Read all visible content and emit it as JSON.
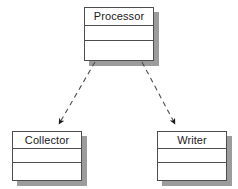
{
  "diagram": {
    "type": "uml-class-diagram",
    "title": "",
    "background_color": "#ffffff",
    "border_color": "#4d4d4d",
    "shadow_color": "#9c9c9c",
    "text_color": "#1a1a1a",
    "classes": [
      {
        "id": "processor",
        "name": "Processor",
        "x": 84,
        "y": 7,
        "width": 70,
        "height": 54,
        "compartments": [
          "name",
          "attributes",
          "operations"
        ],
        "attributes": [],
        "operations": []
      },
      {
        "id": "collector",
        "name": "Collector",
        "x": 12,
        "y": 131,
        "width": 70,
        "height": 50,
        "compartments": [
          "name",
          "attributes",
          "operations"
        ],
        "attributes": [],
        "operations": []
      },
      {
        "id": "writer",
        "name": "Writer",
        "x": 157,
        "y": 131,
        "width": 70,
        "height": 50,
        "compartments": [
          "name",
          "attributes",
          "operations"
        ],
        "attributes": [],
        "operations": []
      }
    ],
    "relationships": [
      {
        "id": "processor-to-collector",
        "from": "processor",
        "to": "collector",
        "style": "dashed",
        "arrowhead": "filled-triangle",
        "label": "",
        "x1": 95,
        "y1": 62,
        "x2": 58,
        "y2": 125
      },
      {
        "id": "processor-to-writer",
        "from": "processor",
        "to": "writer",
        "style": "dashed",
        "arrowhead": "filled-triangle",
        "label": "",
        "x1": 142,
        "y1": 62,
        "x2": 176,
        "y2": 125
      }
    ]
  }
}
